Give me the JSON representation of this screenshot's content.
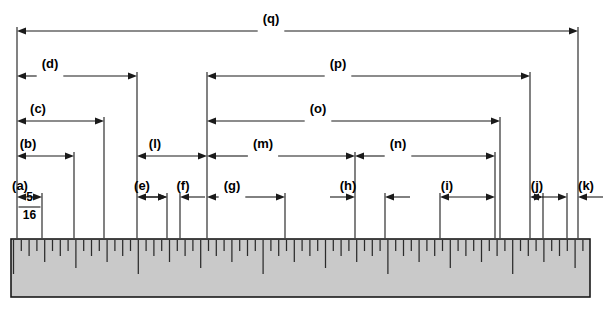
{
  "figure": {
    "background_color": "#ffffff",
    "line_color": "#1a1a1a",
    "ruler_fill_color": "#c9c9c9",
    "tick_color": "#2b2b2b"
  },
  "fraction": {
    "numerator": "5",
    "denominator": "16"
  },
  "dimensions": [
    {
      "id": "a",
      "label": "(a)",
      "x1": 17,
      "x2": 42,
      "y": 197,
      "label_x": 20,
      "label_y": 190,
      "arrow_style": "inward",
      "label_align": "left"
    },
    {
      "id": "b",
      "label": "(b)",
      "x1": 17,
      "x2": 74,
      "y": 156,
      "label_x": 28,
      "label_y": 148,
      "arrow_style": "inward",
      "label_align": "left"
    },
    {
      "id": "c",
      "label": "(c)",
      "x1": 17,
      "x2": 104,
      "y": 121,
      "label_x": 38,
      "label_y": 113,
      "arrow_style": "inward",
      "label_align": "left"
    },
    {
      "id": "d",
      "label": "(d)",
      "x1": 17,
      "x2": 137,
      "y": 76,
      "label_x": 50,
      "label_y": 68,
      "arrow_style": "inward",
      "label_align": "center"
    },
    {
      "id": "e",
      "label": "(e)",
      "x1": 137,
      "x2": 167,
      "y": 197,
      "label_x": 142,
      "label_y": 190,
      "arrow_style": "inward",
      "label_align": "left"
    },
    {
      "id": "f",
      "label": "(f)",
      "x1": 167,
      "x2": 180,
      "y": 197,
      "label_x": 183,
      "label_y": 190,
      "arrow_style": "outward",
      "label_align": "center"
    },
    {
      "id": "g",
      "label": "(g)",
      "x1": 207,
      "x2": 285,
      "y": 197,
      "label_x": 232,
      "label_y": 190,
      "arrow_style": "inward",
      "label_align": "center"
    },
    {
      "id": "h",
      "label": "(h)",
      "x1": 355,
      "x2": 385,
      "y": 197,
      "label_x": 348,
      "label_y": 190,
      "arrow_style": "outward",
      "label_align": "center"
    },
    {
      "id": "i",
      "label": "(i)",
      "x1": 440,
      "x2": 495,
      "y": 197,
      "label_x": 447,
      "label_y": 190,
      "arrow_style": "inward",
      "label_align": "center"
    },
    {
      "id": "j",
      "label": "(j)",
      "x1": 530,
      "x2": 543,
      "y": 197,
      "label_x": 537,
      "label_y": 190,
      "arrow_style": "inward",
      "label_align": "center"
    },
    {
      "id": "k",
      "label": "(k)",
      "x1": 567,
      "x2": 578,
      "y": 197,
      "label_x": 586,
      "label_y": 190,
      "arrow_style": "outward",
      "label_align": "center"
    },
    {
      "id": "l",
      "label": "(l)",
      "x1": 137,
      "x2": 207,
      "y": 156,
      "label_x": 155,
      "label_y": 148,
      "arrow_style": "inward",
      "label_align": "center"
    },
    {
      "id": "m",
      "label": "(m)",
      "x1": 207,
      "x2": 355,
      "y": 156,
      "label_x": 263,
      "label_y": 148,
      "arrow_style": "inward",
      "label_align": "center"
    },
    {
      "id": "n",
      "label": "(n)",
      "x1": 355,
      "x2": 495,
      "y": 156,
      "label_x": 398,
      "label_y": 148,
      "arrow_style": "inward",
      "label_align": "center"
    },
    {
      "id": "o",
      "label": "(o)",
      "x1": 207,
      "x2": 500,
      "y": 121,
      "label_x": 318,
      "label_y": 113,
      "arrow_style": "inward",
      "label_align": "center"
    },
    {
      "id": "p",
      "label": "(p)",
      "x1": 207,
      "x2": 530,
      "y": 76,
      "label_x": 338,
      "label_y": 68,
      "arrow_style": "inward",
      "label_align": "center"
    },
    {
      "id": "q",
      "label": "(q)",
      "x1": 17,
      "x2": 578,
      "y": 31,
      "label_x": 271,
      "label_y": 23,
      "arrow_style": "inward",
      "label_align": "center"
    }
  ],
  "extension_lines": [
    {
      "name": "ext-left-origin",
      "x": 17,
      "y1": 27,
      "y2": 238
    },
    {
      "name": "ext-a-right",
      "x": 42,
      "y1": 193,
      "y2": 238
    },
    {
      "name": "ext-b-right",
      "x": 74,
      "y1": 152,
      "y2": 238
    },
    {
      "name": "ext-c-right",
      "x": 104,
      "y1": 117,
      "y2": 238
    },
    {
      "name": "ext-d-right",
      "x": 137,
      "y1": 72,
      "y2": 238
    },
    {
      "name": "ext-f-left",
      "x": 167,
      "y1": 193,
      "y2": 238
    },
    {
      "name": "ext-f-right",
      "x": 180,
      "y1": 193,
      "y2": 238
    },
    {
      "name": "ext-g-left",
      "x": 207,
      "y1": 72,
      "y2": 238
    },
    {
      "name": "ext-g-right",
      "x": 285,
      "y1": 193,
      "y2": 238
    },
    {
      "name": "ext-h-left",
      "x": 355,
      "y1": 152,
      "y2": 238
    },
    {
      "name": "ext-h-right",
      "x": 385,
      "y1": 193,
      "y2": 238
    },
    {
      "name": "ext-i-left",
      "x": 440,
      "y1": 193,
      "y2": 238
    },
    {
      "name": "ext-i-right",
      "x": 495,
      "y1": 152,
      "y2": 238
    },
    {
      "name": "ext-o-right",
      "x": 500,
      "y1": 117,
      "y2": 238
    },
    {
      "name": "ext-p-right",
      "x": 530,
      "y1": 72,
      "y2": 238
    },
    {
      "name": "ext-j-right",
      "x": 543,
      "y1": 193,
      "y2": 238
    },
    {
      "name": "ext-k-left",
      "x": 567,
      "y1": 193,
      "y2": 238
    },
    {
      "name": "ext-q-right",
      "x": 578,
      "y1": 27,
      "y2": 238
    }
  ],
  "ruler": {
    "name": "ruler",
    "x": 11,
    "y": 239,
    "width": 579,
    "height": 58,
    "tick_top": 240,
    "tick_unit_px": 7.8,
    "tick_levels": [
      {
        "level": "sixteenth",
        "length": 11
      },
      {
        "level": "eighth",
        "length": 16
      },
      {
        "level": "quarter",
        "length": 22
      },
      {
        "level": "half",
        "length": 28
      },
      {
        "level": "inch",
        "length": 34
      }
    ]
  }
}
